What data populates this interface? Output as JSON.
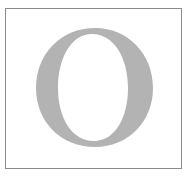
{
  "drop_cap": {
    "letter": "O",
    "color": "#b3b3b3",
    "border_color": "#8a8a8a"
  }
}
